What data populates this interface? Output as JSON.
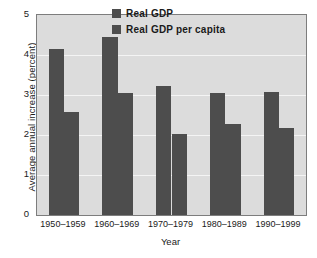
{
  "chart_data": {
    "type": "bar",
    "title": "",
    "xlabel": "Year",
    "ylabel": "Average annual increase (percent)",
    "categories": [
      "1950–1959",
      "1960–1969",
      "1970–1979",
      "1980–1989",
      "1990–1999"
    ],
    "series": [
      {
        "name": "Real GDP",
        "values": [
          4.15,
          4.45,
          3.22,
          3.05,
          3.08
        ]
      },
      {
        "name": "Real GDP per capita",
        "values": [
          2.57,
          3.05,
          2.02,
          2.27,
          2.18
        ]
      }
    ],
    "ylim": [
      0,
      5
    ],
    "yticks": [
      "5",
      "4",
      "3",
      "2",
      "1",
      "0"
    ],
    "ytick_values": [
      5,
      4,
      3,
      2,
      1,
      0
    ],
    "grid": true,
    "grid_axis": "y",
    "legend_position": "top-center",
    "bar_color": "#4d4d4d",
    "plot_background": "#dcdcdc",
    "gridline_color": "#f4f4f4",
    "axis_border_color": "#7d7d7d"
  },
  "legend": {
    "entries": [
      {
        "label": "Real GDP"
      },
      {
        "label": "Real GDP per capita"
      }
    ]
  }
}
